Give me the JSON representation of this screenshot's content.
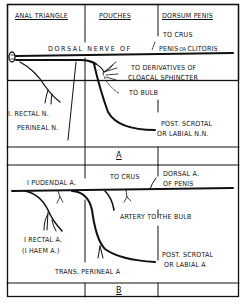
{
  "headers": {
    "col1": "ANAL TRIANGLE",
    "col2": "POUCHES",
    "col3": "DORSUM PENIS"
  },
  "panel_a": {
    "caption": "A",
    "dorsal_nerve": "DORSAL NERVE OF",
    "to_crus": "TO CRUS",
    "penis": "PENIS",
    "or": "OR",
    "clitoris": "CLITORIS",
    "derivatives_1": "TO DERIVATIVES OF",
    "derivatives_2": "CLOACAL SPHINCTER",
    "to_bulb": "TO BULB",
    "rectal_n": "I. RECTAL N.",
    "perineal_n": "PERINEAL N.",
    "scrotal_1": "POST. SCROTAL",
    "scrotal_2": "OR LABIAL N.N."
  },
  "panel_b": {
    "caption": "B",
    "pudendal": "I PUDENDAL A.",
    "to_crus": "TO CRUS",
    "dorsal_1": "DORSAL A.",
    "dorsal_2": "OF PENIS",
    "artery_bulb": "ARTERY TO THE BULB",
    "rectal_1": "I RECTAL A.",
    "rectal_2": "(I HAEM A.)",
    "scrotal_1": "POST. SCROTAL",
    "scrotal_2": "OR LABIAL A",
    "trans_perineal": "TRANS. PERINEAL A"
  }
}
